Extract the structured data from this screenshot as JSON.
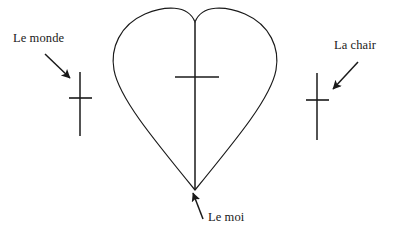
{
  "figure": {
    "type": "diagram",
    "background_color": "#ffffff",
    "stroke_color": "#1a1a1a",
    "labels": {
      "left": "Le monde",
      "right": "La chair",
      "bottom": "Le moi"
    },
    "shapes": {
      "heart": {
        "name": "heart-outline",
        "bounds": {
          "x": 112,
          "y": 12,
          "width": 166,
          "height": 178
        },
        "tip": {
          "x": 195,
          "y": 190
        },
        "cusp": {
          "x": 195,
          "y": 22
        }
      },
      "center_cross": {
        "name": "center-cross",
        "stem": {
          "x": 195,
          "y1": 22,
          "y2": 190
        },
        "bar": {
          "y": 77,
          "x1": 175,
          "x2": 219
        }
      },
      "left_cross": {
        "name": "left-cross",
        "stem": {
          "x": 80,
          "y1": 72,
          "y2": 136
        },
        "bar": {
          "y": 98,
          "x1": 69,
          "x2": 92
        }
      },
      "right_cross": {
        "name": "right-cross",
        "stem": {
          "x": 317,
          "y1": 73,
          "y2": 140
        },
        "bar": {
          "y": 100,
          "x1": 306,
          "x2": 329
        }
      },
      "arrows": [
        {
          "name": "arrow-le-monde",
          "from": {
            "x": 45,
            "y": 54
          },
          "to": {
            "x": 71,
            "y": 79
          }
        },
        {
          "name": "arrow-la-chair",
          "from": {
            "x": 358,
            "y": 62
          },
          "to": {
            "x": 332,
            "y": 90
          }
        },
        {
          "name": "arrow-le-moi",
          "from": {
            "x": 203,
            "y": 219
          },
          "to": {
            "x": 192,
            "y": 192
          }
        }
      ]
    }
  }
}
